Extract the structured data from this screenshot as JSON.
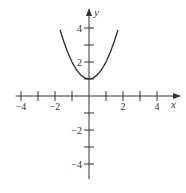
{
  "chart_data": {
    "type": "line",
    "title": "",
    "xlabel": "x",
    "ylabel": "y",
    "xlim": [
      -4.2,
      5.2
    ],
    "ylim": [
      -4.9,
      5.0
    ],
    "grid": false,
    "legend": null,
    "x_ticks": [
      -4,
      -3,
      -2,
      -1,
      1,
      2,
      3,
      4
    ],
    "x_tick_labels": [
      {
        "value": -4,
        "label": "−4"
      },
      {
        "value": -2,
        "label": "−2"
      },
      {
        "value": 2,
        "label": "2"
      },
      {
        "value": 4,
        "label": "4"
      }
    ],
    "y_ticks": [
      -4,
      -3,
      -2,
      -1,
      1,
      2,
      3,
      4
    ],
    "y_tick_labels": [
      {
        "value": 4,
        "label": "4"
      },
      {
        "value": 2,
        "label": "2"
      },
      {
        "value": -2,
        "label": "−2"
      },
      {
        "value": -4,
        "label": "−4"
      }
    ],
    "series": [
      {
        "name": "y = x^2 + 1",
        "x": [
          -1.7,
          -1.5,
          -1.25,
          -1.0,
          -0.75,
          -0.5,
          -0.25,
          0,
          0.25,
          0.5,
          0.75,
          1.0,
          1.25,
          1.5,
          1.7
        ],
        "y": [
          3.89,
          3.25,
          2.56,
          2.0,
          1.56,
          1.25,
          1.06,
          1.0,
          1.06,
          1.25,
          1.56,
          2.0,
          2.56,
          3.25,
          3.89
        ]
      }
    ],
    "color": "#333333"
  }
}
